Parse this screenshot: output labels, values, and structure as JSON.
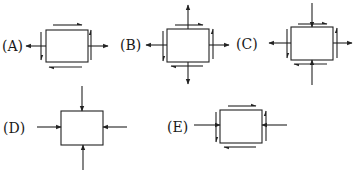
{
  "figure": {
    "options": [
      {
        "id": "A",
        "label": "(A)",
        "normal": "horizontal tension",
        "shear": "yes"
      },
      {
        "id": "B",
        "label": "(B)",
        "normal": "biaxial tension",
        "shear": "yes"
      },
      {
        "id": "C",
        "label": "(C)",
        "normal": "horizontal tension, vertical compression",
        "shear": "yes"
      },
      {
        "id": "D",
        "label": "(D)",
        "normal": "biaxial compression",
        "shear": "no"
      },
      {
        "id": "E",
        "label": "(E)",
        "normal": "horizontal compression",
        "shear": "yes"
      }
    ],
    "colors": {
      "line": "#222222",
      "background": "#ffffff"
    }
  }
}
